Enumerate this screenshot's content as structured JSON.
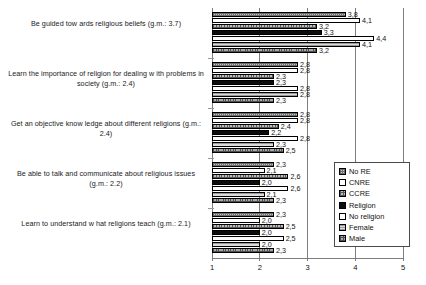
{
  "chart_data": {
    "type": "bar",
    "orientation": "horizontal",
    "title": "",
    "xlabel": "",
    "ylabel": "",
    "xlim": [
      1,
      5
    ],
    "xticks": [
      "1",
      "2",
      "3",
      "4",
      "5"
    ],
    "grid": true,
    "legend_position": "bottom-right",
    "decimal_separator": ",",
    "categories": [
      "Be guided tow ards religious beliefs (g.m.: 3.7)",
      "Learn the importance of religion for dealing w ith problems in society (g.m.: 2.4)",
      "Get an objective know ledge about different religions (g.m.: 2.4)",
      "Be able to talk and communicate about religious issues (g.m.: 2.2)",
      "Learn to understand w hat religions teach (g.m.: 2.1)"
    ],
    "series": [
      {
        "name": "No RE",
        "pattern": "sw-nore",
        "values": [
          3.8,
          2.8,
          2.8,
          2.3,
          2.3
        ]
      },
      {
        "name": "CNRE",
        "pattern": "sw-cnre",
        "values": [
          4.1,
          2.8,
          2.8,
          2.1,
          2.0
        ]
      },
      {
        "name": "CCRE",
        "pattern": "sw-ccre",
        "values": [
          3.2,
          2.3,
          2.4,
          2.6,
          2.5
        ]
      },
      {
        "name": "Religion",
        "pattern": "sw-religion",
        "values": [
          3.3,
          2.3,
          2.2,
          2.0,
          2.0
        ]
      },
      {
        "name": "No religion",
        "pattern": "sw-noreligion",
        "values": [
          4.4,
          2.8,
          2.8,
          2.6,
          2.5
        ]
      },
      {
        "name": "Female",
        "pattern": "sw-female",
        "values": [
          4.1,
          2.8,
          2.3,
          2.1,
          2.0
        ]
      },
      {
        "name": "Male",
        "pattern": "sw-male",
        "values": [
          3.2,
          2.3,
          2.5,
          2.3,
          2.3
        ]
      }
    ],
    "data_labels": [
      [
        "3,8",
        "4,1",
        "3,2",
        "3,3",
        "4,4"
      ],
      [
        "2,3",
        "2,8"
      ],
      [
        "2,8",
        "2,4",
        "2,1",
        "2,2",
        "2,8",
        "2,3",
        "2,5"
      ],
      [
        "2,0",
        "2,6",
        "2,1",
        "2,3"
      ],
      [
        "2,0",
        "2,5",
        "2,0",
        "2,3"
      ]
    ]
  },
  "legend": {
    "items": [
      {
        "label": "No RE",
        "pattern": "sw-nore"
      },
      {
        "label": "CNRE",
        "pattern": "sw-cnre"
      },
      {
        "label": "CCRE",
        "pattern": "sw-ccre"
      },
      {
        "label": "Religion",
        "pattern": "sw-religion"
      },
      {
        "label": "No religion",
        "pattern": "sw-noreligion"
      },
      {
        "label": "Female",
        "pattern": "sw-female"
      },
      {
        "label": "Male",
        "pattern": "sw-male"
      }
    ]
  },
  "axis": {
    "ticks": [
      "1",
      "2",
      "3",
      "4",
      "5"
    ]
  }
}
